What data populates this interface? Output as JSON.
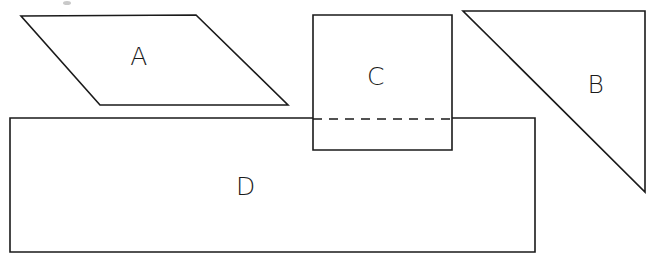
{
  "figure": {
    "canvas": {
      "width": 658,
      "height": 266,
      "background": "#ffffff"
    },
    "stroke_color": "#1a1a1a",
    "fill_color": "#ffffff",
    "shapes": [
      {
        "id": "A",
        "label": "A",
        "kind": "parallelogram",
        "points": "21,16 196,15 288,105 100,105",
        "label_x": 139,
        "label_y": 58
      },
      {
        "id": "B",
        "label": "B",
        "kind": "right-triangle",
        "points": "463,11 645,11 645,192",
        "label_x": 596,
        "label_y": 86
      },
      {
        "id": "C",
        "label": "C",
        "kind": "rectangle",
        "points": "313,15 452,15 452,150 313,150",
        "label_x": 376,
        "label_y": 78
      },
      {
        "id": "D",
        "label": "D",
        "kind": "rectangle",
        "points": "10,118 535,118 535,252 10,252",
        "label_x": 246,
        "label_y": 188
      }
    ],
    "hidden_edges": [
      {
        "id": "c-d-intersection",
        "description": "dashed hidden edge where rectangle C meets rectangle D",
        "x1": 313,
        "y1": 119,
        "x2": 452,
        "y2": 119
      }
    ],
    "artifacts": [
      {
        "id": "scan-speck-top",
        "cx": 67,
        "cy": 3,
        "rx": 4,
        "ry": 2
      }
    ]
  }
}
